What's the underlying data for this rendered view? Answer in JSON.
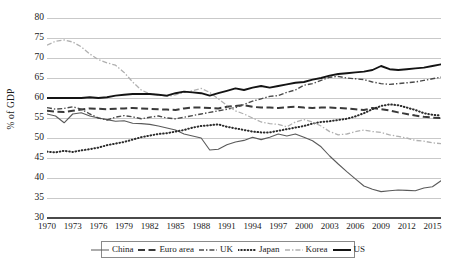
{
  "chart_data": {
    "type": "line",
    "title": "",
    "xlabel": "",
    "ylabel": "% of GDP",
    "xlim": [
      1970,
      2016
    ],
    "ylim": [
      30,
      80
    ],
    "ytick_step": 5,
    "xtick_step": 3,
    "grid": true,
    "legend_position": "bottom",
    "yticks": [
      "80",
      "75",
      "70",
      "65",
      "60",
      "55",
      "50",
      "45",
      "40",
      "35",
      "30"
    ],
    "xticks": [
      "1970",
      "1973",
      "1976",
      "1979",
      "1982",
      "1985",
      "1988",
      "1991",
      "1994",
      "1997",
      "2000",
      "2003",
      "2006",
      "2009",
      "2012",
      "2015"
    ],
    "x": [
      1970,
      1971,
      1972,
      1973,
      1974,
      1975,
      1976,
      1977,
      1978,
      1979,
      1980,
      1981,
      1982,
      1983,
      1984,
      1985,
      1986,
      1987,
      1988,
      1989,
      1990,
      1991,
      1992,
      1993,
      1994,
      1995,
      1996,
      1997,
      1998,
      1999,
      2000,
      2001,
      2002,
      2003,
      2004,
      2005,
      2006,
      2007,
      2008,
      2009,
      2010,
      2011,
      2012,
      2013,
      2014,
      2015,
      2016
    ],
    "series": [
      {
        "name": "China",
        "style": "solid-thin",
        "color": "#5a5a5a",
        "values": [
          56.0,
          55.5,
          53.8,
          56.0,
          56.3,
          55.5,
          55.0,
          54.6,
          54.2,
          54.3,
          53.7,
          53.6,
          53.4,
          53.0,
          52.5,
          52.0,
          51.0,
          50.5,
          50.0,
          47.0,
          47.2,
          48.3,
          49.0,
          49.4,
          50.2,
          49.6,
          50.2,
          51.0,
          50.5,
          51.0,
          50.2,
          49.3,
          47.8,
          45.5,
          43.5,
          41.6,
          39.8,
          38.0,
          37.2,
          36.6,
          36.8,
          37.0,
          36.9,
          36.8,
          37.5,
          37.8,
          39.3
        ]
      },
      {
        "name": "Euro area",
        "style": "dashed",
        "color": "#3a3a3a",
        "values": [
          56.8,
          56.6,
          56.5,
          56.8,
          57.1,
          57.4,
          57.3,
          57.2,
          57.3,
          57.4,
          57.5,
          57.4,
          57.3,
          57.2,
          57.1,
          57.0,
          57.4,
          57.6,
          57.6,
          57.5,
          57.4,
          57.8,
          58.0,
          58.2,
          57.8,
          57.6,
          57.6,
          57.5,
          57.7,
          57.8,
          57.6,
          57.5,
          57.6,
          57.6,
          57.5,
          57.4,
          57.2,
          57.0,
          57.5,
          57.2,
          56.9,
          56.4,
          56.0,
          55.6,
          55.3,
          55.1,
          55.0
        ]
      },
      {
        "name": "UK",
        "style": "dashdot",
        "color": "#4a4a4a",
        "values": [
          57.6,
          57.2,
          57.4,
          57.8,
          57.2,
          56.0,
          55.0,
          54.5,
          55.2,
          55.6,
          55.3,
          54.8,
          55.2,
          55.5,
          55.0,
          54.8,
          55.2,
          55.6,
          56.0,
          56.4,
          56.8,
          57.2,
          57.6,
          58.4,
          59.2,
          59.8,
          60.4,
          60.6,
          61.4,
          62.0,
          63.2,
          63.6,
          64.4,
          65.2,
          65.4,
          65.0,
          64.8,
          64.6,
          64.0,
          63.6,
          63.4,
          63.6,
          63.8,
          64.0,
          64.4,
          64.8,
          65.2
        ]
      },
      {
        "name": "Japan",
        "style": "dotted",
        "color": "#2a2a2a",
        "values": [
          46.6,
          46.4,
          46.8,
          46.5,
          46.9,
          47.2,
          47.6,
          48.2,
          48.6,
          49.0,
          49.6,
          50.2,
          50.6,
          51.0,
          51.2,
          51.6,
          52.0,
          52.6,
          53.0,
          53.2,
          53.4,
          52.8,
          52.4,
          52.0,
          51.6,
          51.4,
          51.4,
          51.8,
          52.2,
          52.6,
          53.0,
          53.6,
          54.0,
          54.2,
          54.5,
          54.8,
          55.4,
          56.2,
          57.2,
          58.0,
          58.4,
          58.2,
          57.6,
          57.0,
          56.2,
          55.8,
          55.6
        ]
      },
      {
        "name": "Korea",
        "style": "dashdot-light",
        "color": "#b0b0b0",
        "values": [
          73.2,
          74.2,
          74.5,
          74.0,
          72.8,
          71.0,
          69.6,
          68.8,
          68.2,
          66.4,
          64.0,
          62.0,
          61.0,
          60.8,
          60.4,
          60.8,
          61.4,
          61.8,
          62.4,
          61.4,
          59.8,
          58.2,
          56.8,
          56.0,
          55.0,
          54.0,
          53.6,
          53.4,
          52.8,
          54.0,
          54.6,
          54.0,
          53.0,
          51.6,
          50.8,
          51.0,
          51.6,
          52.0,
          51.6,
          51.4,
          50.8,
          50.4,
          50.0,
          49.4,
          49.2,
          48.8,
          48.6
        ]
      },
      {
        "name": "US",
        "style": "solid-thick",
        "color": "#141414",
        "values": [
          60.0,
          60.0,
          60.0,
          60.0,
          60.0,
          60.2,
          60.0,
          60.2,
          60.6,
          60.8,
          61.0,
          61.0,
          61.0,
          60.8,
          60.6,
          61.2,
          61.6,
          61.4,
          61.2,
          60.6,
          61.2,
          61.8,
          62.4,
          62.0,
          62.6,
          63.0,
          62.6,
          63.0,
          63.4,
          63.8,
          64.0,
          64.6,
          65.0,
          65.6,
          66.0,
          66.2,
          66.4,
          66.6,
          67.0,
          68.0,
          67.2,
          67.0,
          67.2,
          67.4,
          67.6,
          68.0,
          68.4
        ]
      }
    ]
  },
  "legend": {
    "items": [
      {
        "label": "China",
        "swatch": "solid-thin"
      },
      {
        "label": "Euro area",
        "swatch": "dashed"
      },
      {
        "label": "UK",
        "swatch": "dashdot"
      },
      {
        "label": "Japan",
        "swatch": "dotted"
      },
      {
        "label": "Korea",
        "swatch": "dashdot-light"
      },
      {
        "label": "US",
        "swatch": "solid-thick"
      }
    ]
  },
  "colors": {
    "grid": "#c9c9c9",
    "axis": "#4a4a4a",
    "background": "#ffffff",
    "text": "#1a1a1a"
  }
}
